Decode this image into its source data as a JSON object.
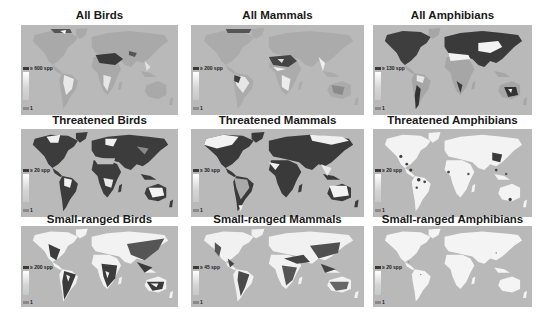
{
  "figure": {
    "panels": [
      {
        "title": "All Birds",
        "legend_max": "≥ 600 spp",
        "legend_min": "1"
      },
      {
        "title": "All Mammals",
        "legend_max": "≥ 200 spp",
        "legend_min": "1"
      },
      {
        "title": "All Amphibians",
        "legend_max": "≥ 130 spp",
        "legend_min": "1"
      },
      {
        "title": "Threatened Birds",
        "legend_max": "≥ 20 spp",
        "legend_min": "1"
      },
      {
        "title": "Threatened Mammals",
        "legend_max": "≥ 30 spp",
        "legend_min": "1"
      },
      {
        "title": "Threatened Amphibians",
        "legend_max": "≥ 20 spp",
        "legend_min": "1"
      },
      {
        "title": "Small-ranged Birds",
        "legend_max": "≥ 200 spp",
        "legend_min": "1"
      },
      {
        "title": "Small-ranged Mammals",
        "legend_max": "≥ 45 spp",
        "legend_min": "1"
      },
      {
        "title": "Small-ranged Amphibians",
        "legend_max": "≥ 20 spp",
        "legend_min": "1"
      }
    ],
    "colors": {
      "ocean": "#b9b9b9",
      "high_richness": "#3a3a3a",
      "low_richness": "#f2f2f2",
      "mid_land": "#a8a8a8"
    }
  }
}
